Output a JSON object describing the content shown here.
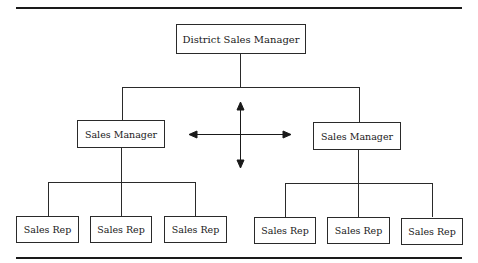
{
  "diagram": {
    "type": "organization-chart",
    "top": {
      "label": "District Sales Manager"
    },
    "managers": [
      {
        "label": "Sales Manager",
        "reps": [
          "Sales Rep",
          "Sales Rep",
          "Sales Rep"
        ]
      },
      {
        "label": "Sales Manager",
        "reps": [
          "Sales Rep",
          "Sales Rep",
          "Sales Rep"
        ]
      }
    ],
    "center_symbol": "four-way-arrow"
  }
}
